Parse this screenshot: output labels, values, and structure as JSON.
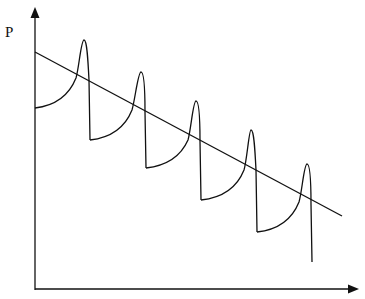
{
  "diagram": {
    "y_axis_label": "P",
    "x_axis_label": "",
    "colors": {
      "stroke": "#111111",
      "background": "#ffffff"
    },
    "cycles": 5,
    "trend": "decreasing"
  }
}
